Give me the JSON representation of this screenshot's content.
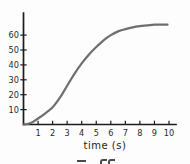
{
  "chart_data": {
    "type": "line",
    "title": "",
    "xlabel": "time (s)",
    "ylabel": "",
    "xlim": [
      0,
      10.5
    ],
    "ylim": [
      0,
      75
    ],
    "x_ticks": [
      1,
      2,
      3,
      4,
      5,
      6,
      7,
      8,
      9,
      10
    ],
    "y_ticks": [
      10,
      20,
      30,
      40,
      50,
      60
    ],
    "grid": false,
    "legend_position": "none",
    "series": [
      {
        "name": "s-curve",
        "x": [
          0,
          0.5,
          1,
          1.5,
          2,
          2.5,
          3,
          3.5,
          4,
          4.5,
          5,
          5.5,
          6,
          6.5,
          7,
          7.5,
          8,
          8.5,
          9,
          9.5,
          9.9
        ],
        "y": [
          0,
          1,
          4,
          7.5,
          11.5,
          18,
          26,
          34,
          41,
          47,
          52,
          56.5,
          60,
          62.5,
          64,
          65.2,
          66,
          66.5,
          67,
          67,
          67
        ]
      }
    ],
    "plateau_value": 67,
    "colors": {
      "curve": "#6e6e6e",
      "axis": "#1c1c1c",
      "tick_label": "#2a2a2a"
    }
  }
}
